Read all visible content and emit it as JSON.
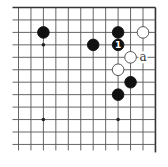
{
  "diagram": {
    "type": "go-board-corner",
    "visible_region": "upper-right corner",
    "columns": 12,
    "rows": 12,
    "edges": [
      "top",
      "right"
    ],
    "star_points": [
      {
        "col": 2,
        "row": 3
      },
      {
        "col": 2,
        "row": 9
      },
      {
        "col": 8,
        "row": 9
      }
    ],
    "stones": [
      {
        "color": "black",
        "col": 2,
        "row": 2,
        "label": ""
      },
      {
        "color": "black",
        "col": 6,
        "row": 3,
        "label": ""
      },
      {
        "color": "black",
        "col": 8,
        "row": 2,
        "label": ""
      },
      {
        "color": "black",
        "col": 8,
        "row": 3,
        "label": "1"
      },
      {
        "color": "white",
        "col": 10,
        "row": 2,
        "label": ""
      },
      {
        "color": "white",
        "col": 9,
        "row": 4,
        "label": ""
      },
      {
        "color": "white",
        "col": 8,
        "row": 5,
        "label": ""
      },
      {
        "color": "black",
        "col": 9,
        "row": 6,
        "label": ""
      },
      {
        "color": "black",
        "col": 8,
        "row": 7,
        "label": ""
      }
    ],
    "marks": [
      {
        "col": 10,
        "row": 4,
        "text": "a"
      }
    ],
    "colors": {
      "black_stone": "#111111",
      "white_stone": "#ffffff",
      "grid": "#555555"
    }
  }
}
